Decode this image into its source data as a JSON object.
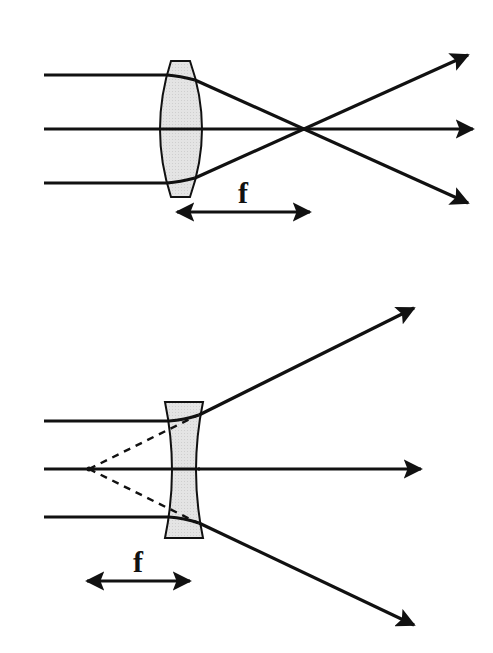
{
  "colors": {
    "ray": "#111111",
    "lens_fill": "#e2e2e2",
    "lens_stroke": "#111111",
    "background": "#ffffff"
  },
  "diagrams": [
    {
      "name": "converging-lens",
      "lens_type": "convex",
      "focal_label": "f",
      "rays_in": 3,
      "rays_out": 3
    },
    {
      "name": "diverging-lens",
      "lens_type": "concave",
      "focal_label": "f",
      "rays_in": 3,
      "rays_out": 3,
      "virtual_rays": "dashed"
    }
  ]
}
